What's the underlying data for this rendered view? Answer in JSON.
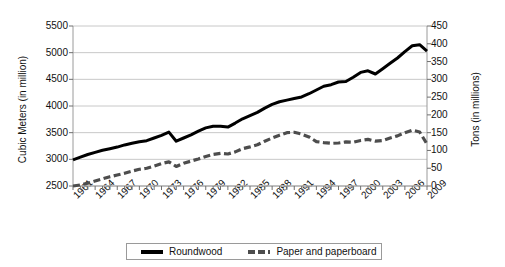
{
  "chart_data": {
    "type": "line",
    "title": "",
    "xlabel": "",
    "grid": "horizontal",
    "legend_position": "bottom",
    "x": [
      1961,
      1962,
      1963,
      1964,
      1965,
      1966,
      1967,
      1968,
      1969,
      1970,
      1971,
      1972,
      1973,
      1974,
      1975,
      1976,
      1977,
      1978,
      1979,
      1980,
      1981,
      1982,
      1983,
      1984,
      1985,
      1986,
      1987,
      1988,
      1989,
      1990,
      1991,
      1992,
      1993,
      1994,
      1995,
      1996,
      1997,
      1998,
      1999,
      2000,
      2001,
      2002,
      2003,
      2004,
      2005,
      2006,
      2007,
      2008,
      2009
    ],
    "xtick_labels": [
      "1961",
      "1964",
      "1967",
      "1970",
      "1973",
      "1976",
      "1979",
      "1982",
      "1985",
      "1988",
      "1991",
      "1994",
      "1997",
      "2000",
      "2003",
      "2006",
      "2009"
    ],
    "xtick_step_years": 3,
    "y_left": {
      "label": "Cubic Meters (in million)",
      "ticks": [
        2500,
        3000,
        3500,
        4000,
        4500,
        5000,
        5500
      ],
      "ylim": [
        2500,
        5500
      ]
    },
    "y_right": {
      "label": "Tons (in millions)",
      "ticks": [
        0,
        50,
        100,
        150,
        200,
        250,
        300,
        350,
        400,
        450
      ],
      "ylim": [
        0,
        450
      ]
    },
    "series": [
      {
        "name": "Roundwood",
        "axis": "left",
        "unit": "million cubic meters",
        "color": "#000000",
        "style": "solid",
        "values": [
          2990,
          3040,
          3090,
          3130,
          3170,
          3200,
          3230,
          3270,
          3300,
          3330,
          3350,
          3400,
          3450,
          3510,
          3340,
          3400,
          3460,
          3530,
          3590,
          3620,
          3620,
          3605,
          3680,
          3760,
          3820,
          3880,
          3960,
          4030,
          4080,
          4110,
          4140,
          4170,
          4230,
          4300,
          4370,
          4400,
          4450,
          4460,
          4540,
          4630,
          4660,
          4600,
          4700,
          4800,
          4900,
          5020,
          5130,
          5150,
          5030
        ]
      },
      {
        "name": "Paper and paperboard",
        "axis": "right",
        "unit": "million tons",
        "color": "#4d4d4d",
        "style": "dashed",
        "values": [
          0,
          3,
          8,
          14,
          20,
          26,
          31,
          36,
          42,
          47,
          50,
          56,
          63,
          68,
          55,
          64,
          70,
          76,
          83,
          89,
          92,
          90,
          96,
          105,
          110,
          116,
          126,
          135,
          143,
          150,
          151,
          146,
          138,
          125,
          122,
          120,
          121,
          124,
          123,
          128,
          131,
          126,
          128,
          135,
          141,
          150,
          157,
          152,
          118
        ]
      }
    ],
    "annotations": []
  },
  "legend": {
    "items": [
      {
        "label": "Roundwood",
        "style": "solid"
      },
      {
        "label": "Paper and paperboard",
        "style": "dashed"
      }
    ]
  }
}
